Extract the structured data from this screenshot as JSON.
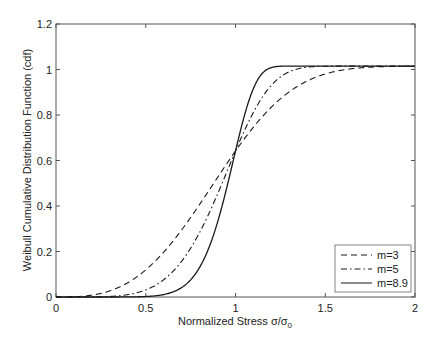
{
  "chart_data": {
    "type": "line",
    "title": "",
    "xlabel": "Normalized Stress σ/σ0",
    "xlabel_main": "Normalized Stress σ/σ",
    "xlabel_sub": "0",
    "ylabel": "Weibull Cumulative Distribution Function (cdf)",
    "xlim": [
      0,
      2
    ],
    "ylim": [
      0,
      1.2
    ],
    "xticks": [
      0,
      0.5,
      1,
      1.5,
      2
    ],
    "xtick_labels": [
      "0",
      "0.5",
      "1",
      "1.5",
      "2"
    ],
    "yticks": [
      0,
      0.2,
      0.4,
      0.6,
      0.8,
      1,
      1.2
    ],
    "ytick_labels": [
      "0",
      "0.2",
      "0.4",
      "0.6",
      "0.8",
      "1",
      "1.2"
    ],
    "grid": false,
    "legend_position": "lower right",
    "x": [
      0,
      0.2,
      0.4,
      0.5,
      0.6,
      0.7,
      0.8,
      0.9,
      1.0,
      1.1,
      1.2,
      1.3,
      1.4,
      1.5,
      1.6,
      1.8,
      2.0
    ],
    "series": [
      {
        "name": "m=3",
        "style": "dashed",
        "values": [
          0,
          0.008,
          0.062,
          0.119,
          0.198,
          0.296,
          0.407,
          0.526,
          0.642,
          0.75,
          0.837,
          0.904,
          0.948,
          0.975,
          0.998,
          1.012,
          1.015
        ]
      },
      {
        "name": "m=5",
        "style": "dashdot",
        "values": [
          0,
          0.0003,
          0.01,
          0.031,
          0.075,
          0.156,
          0.281,
          0.448,
          0.642,
          0.825,
          0.948,
          0.998,
          1.013,
          1.015,
          1.015,
          1.015,
          1.015
        ]
      },
      {
        "name": "m=8.9",
        "style": "solid",
        "values": [
          0,
          0,
          0.0003,
          0.002,
          0.011,
          0.041,
          0.13,
          0.314,
          0.642,
          0.93,
          1.012,
          1.015,
          1.015,
          1.015,
          1.015,
          1.015,
          1.015
        ]
      }
    ]
  },
  "legend": {
    "items": [
      {
        "label": "m=3",
        "style": "dashed"
      },
      {
        "label": "m=5",
        "style": "dashdot"
      },
      {
        "label": "m=8.9",
        "style": "solid"
      }
    ]
  },
  "colors": {
    "axis": "#555555",
    "line": "#1a1a1a",
    "background": "#ffffff"
  }
}
